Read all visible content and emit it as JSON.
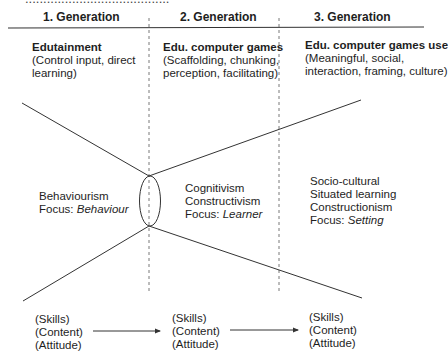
{
  "clipped_top_text": "........................................",
  "generations": [
    {
      "header": "1. Generation",
      "title": "Edutainment",
      "desc": [
        "(Control input, direct",
        "learning)"
      ],
      "theory": [
        "Behaviourism"
      ],
      "focus_label": "Focus: ",
      "focus": "Behaviour",
      "outcomes": [
        "(Skills)",
        "(Content)",
        "(Attitude)"
      ]
    },
    {
      "header": "2. Generation",
      "title": "Edu. computer games",
      "desc": [
        "(Scaffolding, chunking,",
        "perception, facilitating)"
      ],
      "theory": [
        "Cognitivism",
        "Constructivism"
      ],
      "focus_label": "Focus: ",
      "focus": "Learner",
      "outcomes": [
        "(Skills)",
        "(Content)",
        "(Attitude)"
      ]
    },
    {
      "header": "3. Generation",
      "title": "Edu. computer games use",
      "desc": [
        "(Meaningful, social,",
        "interaction, framing, culture)"
      ],
      "theory": [
        "Socio-cultural",
        "Situated learning",
        "Constructionism"
      ],
      "focus_label": "Focus: ",
      "focus": "Setting",
      "outcomes": [
        "(Skills)",
        "(Content)",
        "(Attitude)"
      ]
    }
  ],
  "colors": {
    "line": "#333333",
    "text": "#1e1e1e"
  }
}
